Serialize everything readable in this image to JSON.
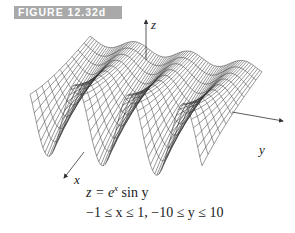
{
  "figure": {
    "label": "FIGURE 12.32d",
    "label_bg_color": "#a9a9a9",
    "label_text_color": "#ffffff"
  },
  "plot": {
    "type": "3d-wireframe-surface",
    "axes": {
      "x": "x",
      "y": "y",
      "z": "z"
    },
    "function": "z = e^x sin y",
    "domain": "−1 ≤ x ≤ 1, −10 ≤ y ≤ 10",
    "line_color": "#333333"
  },
  "caption": {
    "eq_lhs": "z = e",
    "eq_exp": "x",
    "eq_rhs": " sin y",
    "range": "−1 ≤ x ≤ 1, −10 ≤ y ≤ 10"
  }
}
